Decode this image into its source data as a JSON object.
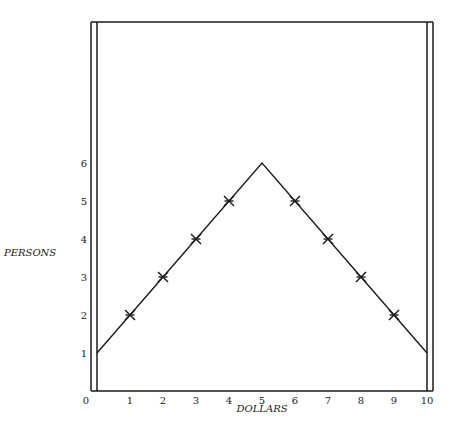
{
  "chart_data": {
    "type": "line",
    "title": "",
    "xlabel": "DOLLARS",
    "ylabel": "PERSONS",
    "xlim": [
      0,
      10
    ],
    "ylim": [
      0,
      6
    ],
    "grid": false,
    "x_ticks": [
      "0",
      "1",
      "2",
      "3",
      "4",
      "5",
      "6",
      "7",
      "8",
      "9",
      "10"
    ],
    "y_ticks": [
      "1",
      "2",
      "3",
      "4",
      "5",
      "6"
    ],
    "series": [
      {
        "name": "distribution",
        "x": [
          0,
          5,
          10
        ],
        "y": [
          1,
          6,
          1
        ]
      }
    ],
    "markers": {
      "symbol": "star",
      "x": [
        1,
        2,
        3,
        4,
        6,
        7,
        8,
        9
      ],
      "y": [
        2,
        3,
        4,
        5,
        5,
        4,
        3,
        2
      ]
    },
    "colors": {
      "ink": "#1a1a1a",
      "background": "#ffffff"
    }
  }
}
